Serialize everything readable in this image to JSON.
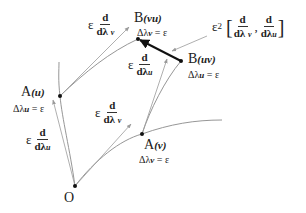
{
  "diagram": {
    "points": {
      "O": {
        "label": "O",
        "x": 75,
        "y": 186
      },
      "A_u": {
        "label": "A",
        "sub": "(u)",
        "delta": "Δλ",
        "delta_sub": "u",
        "delta_rhs": " = ε",
        "x": 60,
        "y": 96
      },
      "A_v": {
        "label": "A",
        "sub": "(v)",
        "delta": "Δλ",
        "delta_sub": "v",
        "delta_rhs": " = ε",
        "x": 142,
        "y": 134
      },
      "B_vu": {
        "label": "B",
        "sub": "(vu)",
        "delta": "Δλ",
        "delta_sub": "v",
        "delta_rhs": " = ε",
        "x": 138,
        "y": 39
      },
      "B_uv": {
        "label": "B",
        "sub": "(uv)",
        "delta": "Δλ",
        "delta_sub": "u",
        "delta_rhs": " = ε",
        "x": 181,
        "y": 61
      }
    },
    "vectors": {
      "eps_d_dlv_top": {
        "eps": "ε",
        "num": "d",
        "den": "dλ",
        "den_sub": "v"
      },
      "eps_d_dlu_mid": {
        "eps": "ε",
        "num": "d",
        "den": "dλ",
        "den_sub": "u"
      },
      "eps_d_dlv_mid": {
        "eps": "ε",
        "num": "d",
        "den": "dλ",
        "den_sub": "v"
      },
      "eps_d_dlu_left": {
        "eps": "ε",
        "num": "d",
        "den": "dλ",
        "den_sub": "u"
      }
    },
    "commutator": {
      "eps": "ε",
      "power": "2",
      "open": "[",
      "close": "]",
      "sep": ",",
      "a_num": "d",
      "a_den": "dλ",
      "a_sub": "v",
      "b_num": "d",
      "b_den": "dλ",
      "b_sub": "u"
    },
    "colors": {
      "curve": "#8a8a8a",
      "arrow": "#9a9a9a",
      "gap": "#111111",
      "point": "#111111"
    }
  }
}
